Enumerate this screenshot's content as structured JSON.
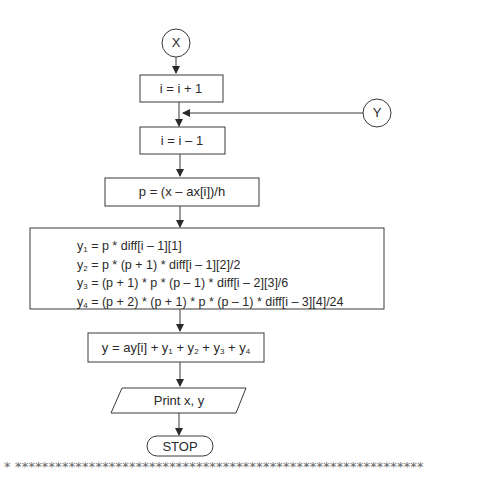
{
  "diagram": {
    "type": "flowchart",
    "nodes": {
      "connector_x": "X",
      "connector_y": "Y",
      "increment": "i = i + 1",
      "decrement": "i = i – 1",
      "compute_p": "p = (x – ax[i])/h",
      "compute_terms": [
        {
          "var": "y",
          "sub": "1",
          "expr": " = p * diff[i – 1][1]"
        },
        {
          "var": "y",
          "sub": "2",
          "expr": " = p * (p + 1) * diff[i – 1][2]/2"
        },
        {
          "var": "y",
          "sub": "3",
          "expr": " = (p + 1) * p * (p – 1) * diff[i – 2][3]/6"
        },
        {
          "var": "y",
          "sub": "4",
          "expr": " = (p + 2) * (p + 1) * p * (p – 1) * diff[i – 3][4]/24"
        }
      ],
      "sum": {
        "prefix": "y = ay[i] + y",
        "s1": "1",
        "p1": " + y",
        "s2": "2",
        "p2": " + y",
        "s3": "3",
        "p3": " +  y",
        "s4": "4"
      },
      "output": "Print  x, y",
      "terminator": "STOP"
    },
    "separator": "* *************************************************************"
  }
}
